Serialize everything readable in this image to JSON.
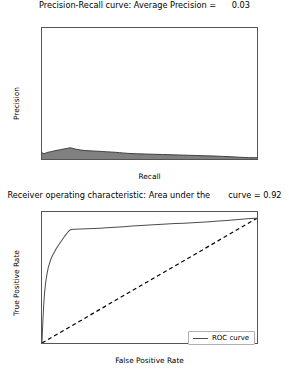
{
  "figure": {
    "width": 289,
    "height": 377,
    "background": "#ffffff"
  },
  "chart_data": [
    {
      "id": "precision-recall",
      "type": "area",
      "title": "Precision-Recall curve: Average Precision =      0.03",
      "title_text": "Precision-Recall curve: Average Precision =",
      "metric_label": "Average Precision",
      "metric_value": "0.03",
      "xlabel": "Recall",
      "ylabel": "Precision",
      "xlim": [
        0.0,
        1.0
      ],
      "ylim": [
        0.0,
        1.05
      ],
      "xticks": [
        "0.0",
        "0.2",
        "0.4",
        "0.6",
        "0.8",
        "1.0"
      ],
      "xtick_values": [
        0.0,
        0.2,
        0.4,
        0.6,
        0.8,
        1.0
      ],
      "yticks": [
        "0.0",
        "0.2",
        "0.4",
        "0.6",
        "0.8",
        "1.0"
      ],
      "ytick_values": [
        0.0,
        0.2,
        0.4,
        0.6,
        0.8,
        1.0
      ],
      "grid": false,
      "legend": null,
      "fill_color": "#808080",
      "line_color": "#333333",
      "x": [
        0.0,
        0.01,
        0.02,
        0.03,
        0.04,
        0.05,
        0.06,
        0.07,
        0.08,
        0.09,
        0.1,
        0.11,
        0.12,
        0.13,
        0.14,
        0.15,
        0.16,
        0.18,
        0.2,
        0.22,
        0.24,
        0.26,
        0.28,
        0.3,
        0.32,
        0.34,
        0.36,
        0.38,
        0.4,
        0.44,
        0.48,
        0.52,
        0.56,
        0.6,
        0.64,
        0.68,
        0.72,
        0.76,
        0.8,
        0.84,
        0.88,
        0.92,
        0.96,
        1.0
      ],
      "y": [
        0.05,
        0.042,
        0.05,
        0.055,
        0.058,
        0.062,
        0.066,
        0.07,
        0.073,
        0.077,
        0.08,
        0.083,
        0.086,
        0.09,
        0.087,
        0.082,
        0.078,
        0.072,
        0.068,
        0.066,
        0.064,
        0.062,
        0.06,
        0.058,
        0.056,
        0.054,
        0.051,
        0.048,
        0.045,
        0.042,
        0.04,
        0.038,
        0.036,
        0.034,
        0.032,
        0.03,
        0.028,
        0.026,
        0.024,
        0.021,
        0.018,
        0.014,
        0.011,
        0.01
      ]
    },
    {
      "id": "roc",
      "type": "line",
      "title": "Receiver operating characteristic: Area under the       curve = 0.92",
      "title_text": "Receiver operating characteristic: Area under the",
      "metric_label": "curve",
      "metric_value": "0.92",
      "xlabel": "False Positive Rate",
      "ylabel": "True Positive Rate",
      "xlim": [
        0.0,
        1.0
      ],
      "ylim": [
        0.0,
        1.05
      ],
      "xticks": [
        "0.0",
        "0.2",
        "0.4",
        "0.6",
        "0.8",
        "1.0"
      ],
      "xtick_values": [
        0.0,
        0.2,
        0.4,
        0.6,
        0.8,
        1.0
      ],
      "yticks": [
        "0.0",
        "0.2",
        "0.4",
        "0.6",
        "0.8",
        "1.0"
      ],
      "ytick_values": [
        0.0,
        0.2,
        0.4,
        0.6,
        0.8,
        1.0
      ],
      "grid": false,
      "legend": {
        "position": "lower right",
        "entries": [
          "ROC curve"
        ]
      },
      "line_color": "#4d4d4d",
      "chance_line_color": "#000000",
      "chance_line_style": "dashed",
      "series": [
        {
          "name": "ROC curve",
          "x": [
            0.0,
            0.002,
            0.004,
            0.006,
            0.008,
            0.01,
            0.013,
            0.016,
            0.02,
            0.025,
            0.03,
            0.036,
            0.042,
            0.05,
            0.058,
            0.066,
            0.075,
            0.085,
            0.095,
            0.105,
            0.115,
            0.125,
            0.135,
            0.15,
            0.18,
            0.21,
            0.24,
            0.27,
            0.3,
            0.34,
            0.38,
            0.42,
            0.46,
            0.5,
            0.54,
            0.58,
            0.62,
            0.66,
            0.7,
            0.74,
            0.78,
            0.82,
            0.86,
            0.9,
            0.94,
            0.97,
            1.0
          ],
          "y": [
            0.0,
            0.09,
            0.17,
            0.24,
            0.3,
            0.36,
            0.42,
            0.47,
            0.52,
            0.57,
            0.61,
            0.645,
            0.675,
            0.705,
            0.73,
            0.755,
            0.78,
            0.805,
            0.83,
            0.855,
            0.878,
            0.898,
            0.91,
            0.912,
            0.913,
            0.915,
            0.917,
            0.92,
            0.923,
            0.928,
            0.932,
            0.937,
            0.942,
            0.946,
            0.95,
            0.953,
            0.957,
            0.96,
            0.963,
            0.967,
            0.972,
            0.977,
            0.982,
            0.988,
            0.994,
            0.998,
            1.0
          ]
        },
        {
          "name": "chance",
          "x": [
            0.0,
            1.0
          ],
          "y": [
            0.0,
            1.0
          ]
        }
      ]
    }
  ]
}
